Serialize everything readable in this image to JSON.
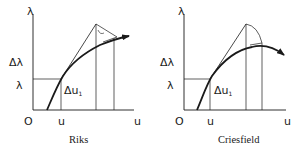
{
  "panels": [
    {
      "caption": "Riks",
      "axis_y_label": "λ",
      "axis_x_label": "u",
      "origin_label": "O",
      "delta_lambda_label": "Δλ",
      "lambda_label": "λ",
      "u_label": "u",
      "delta_u_label": "Δu",
      "delta_u_sub": "1"
    },
    {
      "caption": "Criesfield",
      "axis_y_label": "λ",
      "axis_x_label": "u",
      "origin_label": "O",
      "delta_lambda_label": "Δλ",
      "lambda_label": "λ",
      "u_label": "u",
      "delta_u_label": "Δu",
      "delta_u_sub": "1"
    }
  ],
  "colors": {
    "ink": "#1a1a1a",
    "background": "#ffffff"
  }
}
